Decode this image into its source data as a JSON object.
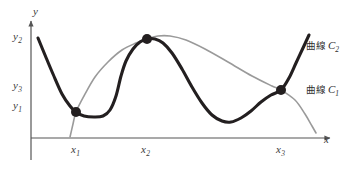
{
  "chart_data": {
    "type": "line",
    "title": "",
    "xlabel": "x",
    "ylabel": "y",
    "grid": false,
    "legend_position": "right",
    "axes": {
      "x_axis_label": "x",
      "y_axis_label": "y",
      "x_tick_labels": [
        "x₁",
        "x₂",
        "x₃"
      ],
      "y_tick_labels": [
        "y₂",
        "y₃",
        "y₁"
      ],
      "x_ticks_ordered": [
        "x1",
        "x2",
        "x3"
      ],
      "y_ticks_ordered_top_to_bottom": [
        "y2",
        "y3",
        "y1"
      ],
      "origin_px": [
        31,
        138
      ],
      "x_axis_end_px": [
        332,
        138
      ],
      "y_axis_end_px": [
        31,
        18
      ],
      "arrowheads": [
        "x-axis-right",
        "y-axis-top"
      ]
    },
    "series": [
      {
        "name": "曲線 C₁",
        "legend_label_parts": {
          "word": "曲線",
          "symbol": "C",
          "subscript": "1"
        },
        "style": "thin-gray",
        "color": "#9a9a9a",
        "width_px": 1.6,
        "description": "Gently rising then slowly falling smooth curve; rises from low left, broad maximum just right of x2, declines across to lower right.",
        "points_px": [
          [
            70,
            137
          ],
          [
            73,
            124
          ],
          [
            76,
            112
          ],
          [
            84,
            96
          ],
          [
            95,
            77
          ],
          [
            108,
            62
          ],
          [
            122,
            50
          ],
          [
            136,
            43
          ],
          [
            147,
            39
          ],
          [
            158,
            36
          ],
          [
            170,
            36
          ],
          [
            186,
            40
          ],
          [
            205,
            49
          ],
          [
            228,
            62
          ],
          [
            252,
            76
          ],
          [
            272,
            86
          ],
          [
            281,
            90
          ],
          [
            295,
            100
          ],
          [
            305,
            114
          ],
          [
            312,
            126
          ],
          [
            316,
            133
          ]
        ]
      },
      {
        "name": "曲線 C₂",
        "legend_label_parts": {
          "word": "曲線",
          "symbol": "C",
          "subscript": "2"
        },
        "style": "thick-dark",
        "color": "#231f20",
        "width_px": 3.1,
        "description": "Wavy curve: falls from upper left to a minimum at x1, short flat dip, steep rise to a peak at x2, long fall to a valley, then steep rise through x3 to upper right.",
        "points_px": [
          [
            38,
            38
          ],
          [
            45,
            55
          ],
          [
            53,
            74
          ],
          [
            62,
            94
          ],
          [
            70,
            106
          ],
          [
            76,
            112
          ],
          [
            84,
            116
          ],
          [
            94,
            117
          ],
          [
            103,
            116
          ],
          [
            110,
            110
          ],
          [
            116,
            96
          ],
          [
            121,
            76
          ],
          [
            126,
            61
          ],
          [
            133,
            49
          ],
          [
            140,
            42
          ],
          [
            147,
            39
          ],
          [
            155,
            39
          ],
          [
            163,
            43
          ],
          [
            172,
            53
          ],
          [
            182,
            69
          ],
          [
            192,
            87
          ],
          [
            202,
            103
          ],
          [
            212,
            115
          ],
          [
            222,
            121
          ],
          [
            231,
            122
          ],
          [
            241,
            118
          ],
          [
            251,
            111
          ],
          [
            261,
            102
          ],
          [
            271,
            95
          ],
          [
            281,
            90
          ],
          [
            289,
            78
          ],
          [
            296,
            63
          ],
          [
            303,
            48
          ],
          [
            309,
            35
          ]
        ]
      }
    ],
    "intersection_points": [
      {
        "name": "intersection-x1",
        "label": "x₁",
        "px": [
          76,
          112
        ],
        "x_tick": "x1",
        "y_tick": "y1"
      },
      {
        "name": "intersection-x2",
        "label": "x₂",
        "px": [
          147,
          39
        ],
        "x_tick": "x2",
        "y_tick": "y2"
      },
      {
        "name": "intersection-x3",
        "label": "x₃",
        "px": [
          281,
          90
        ],
        "x_tick": "x3",
        "y_tick": "y3"
      }
    ],
    "marker": {
      "shape": "circle",
      "color": "#231f20",
      "radius_px": 5
    },
    "colors": {
      "background": "#ffffff",
      "axis": "#555555",
      "curve_c1": "#9a9a9a",
      "curve_c2": "#231f20",
      "marker": "#231f20",
      "text": "#3a3a3a"
    }
  },
  "axis_labels": {
    "y_axis": "y",
    "x_axis": "x",
    "y2": {
      "base": "y",
      "sub": "2"
    },
    "y3": {
      "base": "y",
      "sub": "3"
    },
    "y1": {
      "base": "y",
      "sub": "1"
    },
    "x1": {
      "base": "x",
      "sub": "1"
    },
    "x2": {
      "base": "x",
      "sub": "2"
    },
    "x3": {
      "base": "x",
      "sub": "3"
    }
  },
  "legend": {
    "items": [
      {
        "word": "曲線",
        "symbol": "C",
        "sub": "2",
        "target": "curve-c2"
      },
      {
        "word": "曲線",
        "symbol": "C",
        "sub": "1",
        "target": "curve-c1"
      }
    ]
  }
}
